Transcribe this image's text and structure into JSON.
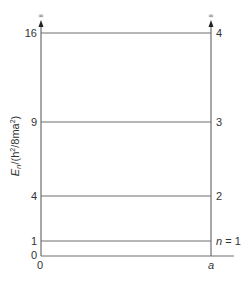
{
  "diagram": {
    "y_axis_label": {
      "prefix": "E",
      "sub": "n",
      "mid": "/(h",
      "sup1": "2",
      "mid2": "/8ma",
      "sup2": "2",
      "suffix": ")"
    },
    "x_labels": {
      "left": "0",
      "right": "a"
    },
    "infinity_symbol": "∞",
    "levels": [
      {
        "energy": "0",
        "quantum": ""
      },
      {
        "energy": "1",
        "quantum": "n = 1"
      },
      {
        "energy": "4",
        "quantum": "2"
      },
      {
        "energy": "9",
        "quantum": "3"
      },
      {
        "energy": "16",
        "quantum": "4"
      }
    ],
    "colors": {
      "line": "#6e6e6e",
      "text": "#333333"
    }
  }
}
